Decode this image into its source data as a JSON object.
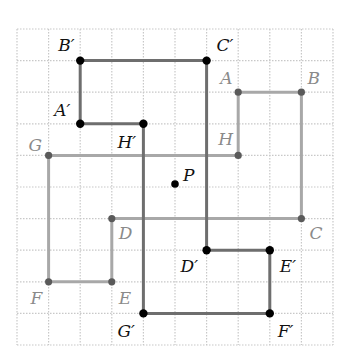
{
  "diagram": {
    "grid": {
      "cols": 10,
      "rows": 10,
      "origin_x": 17,
      "origin_y": 29,
      "cell": 31.6,
      "line_color": "#c8c8c8"
    },
    "original_shape": {
      "color": "#a8a8a8",
      "vertices": [
        {
          "name": "A",
          "label": "A",
          "col": 7,
          "row": 2,
          "dx": -18,
          "dy": -8
        },
        {
          "name": "B",
          "label": "B",
          "col": 9,
          "row": 2,
          "dx": 6,
          "dy": -8
        },
        {
          "name": "C",
          "label": "C",
          "col": 9,
          "row": 6,
          "dx": 8,
          "dy": 20
        },
        {
          "name": "D",
          "label": "D",
          "col": 3,
          "row": 6,
          "dx": 7,
          "dy": 20
        },
        {
          "name": "E",
          "label": "E",
          "col": 3,
          "row": 8,
          "dx": 7,
          "dy": 22
        },
        {
          "name": "F",
          "label": "F",
          "col": 1,
          "row": 8,
          "dx": -18,
          "dy": 22
        },
        {
          "name": "G",
          "label": "G",
          "col": 1,
          "row": 4,
          "dx": -20,
          "dy": -4
        },
        {
          "name": "H",
          "label": "H",
          "col": 7,
          "row": 4,
          "dx": -20,
          "dy": -10
        }
      ]
    },
    "image_shape": {
      "color": "#6e6e6e",
      "vertices": [
        {
          "name": "A-prime",
          "label": "A′",
          "col": 2,
          "row": 3,
          "dx": -26,
          "dy": -8
        },
        {
          "name": "B-prime",
          "label": "B′",
          "col": 2,
          "row": 1,
          "dx": -22,
          "dy": -10
        },
        {
          "name": "C-prime",
          "label": "C′",
          "col": 6,
          "row": 1,
          "dx": 10,
          "dy": -10
        },
        {
          "name": "D-prime",
          "label": "D′",
          "col": 6,
          "row": 7,
          "dx": -26,
          "dy": 22
        },
        {
          "name": "E-prime",
          "label": "E′",
          "col": 8,
          "row": 7,
          "dx": 10,
          "dy": 22
        },
        {
          "name": "F-prime",
          "label": "F′",
          "col": 8,
          "row": 9,
          "dx": 8,
          "dy": 24
        },
        {
          "name": "G-prime",
          "label": "G′",
          "col": 4,
          "row": 9,
          "dx": -26,
          "dy": 24
        },
        {
          "name": "H-prime",
          "label": "H′",
          "col": 4,
          "row": 3,
          "dx": -26,
          "dy": 24
        }
      ]
    },
    "center": {
      "name": "P",
      "label": "P",
      "col": 5,
      "row": 5,
      "dx": 8,
      "dy": -6
    }
  }
}
